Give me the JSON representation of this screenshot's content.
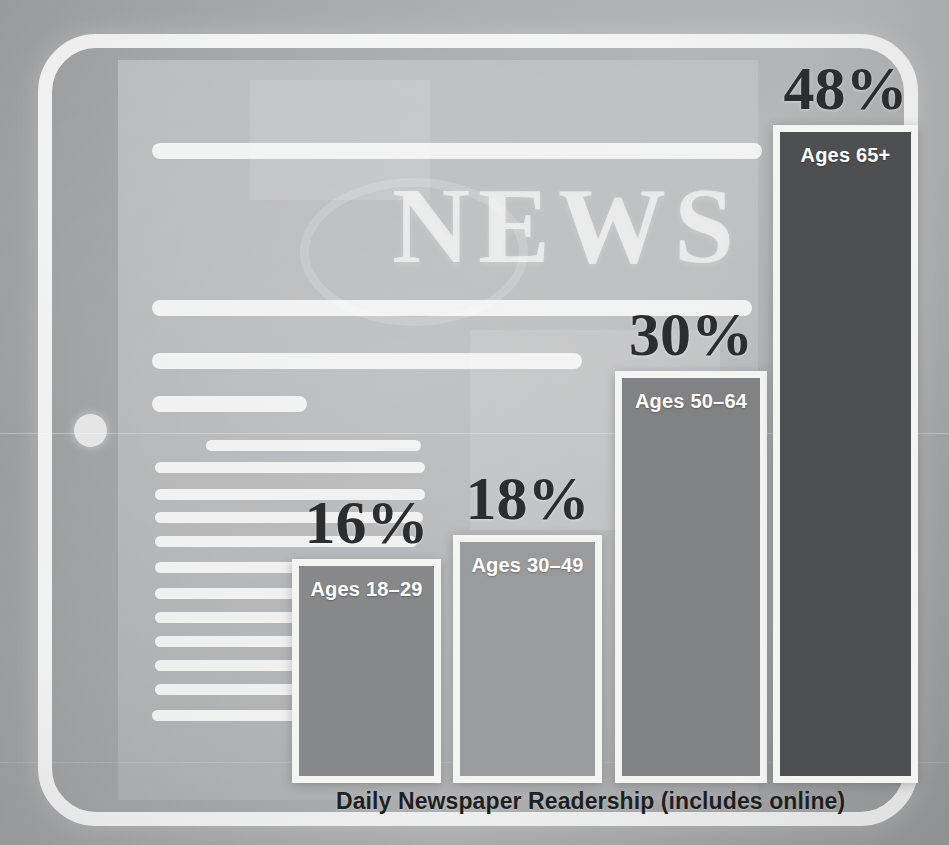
{
  "chart_data": {
    "type": "bar",
    "title": "Daily Newspaper Readership (includes online)",
    "xlabel": "",
    "ylabel": "",
    "ylim": [
      0,
      52
    ],
    "grid": false,
    "legend": "none",
    "categories": [
      "Ages 18–29",
      "Ages 30–49",
      "Ages 50–64",
      "Ages 65+"
    ],
    "values": [
      16,
      18,
      30,
      48
    ],
    "value_labels": [
      "16%",
      "18%",
      "30%",
      "48%"
    ],
    "series": [
      {
        "name": "Daily Newspaper Readership (includes online)",
        "values": [
          16,
          18,
          30,
          48
        ]
      }
    ],
    "bar_colors": [
      "#87888a",
      "#9a9b9d",
      "#818284",
      "#4e4f51"
    ],
    "bar_border_color": "#f4f4f3"
  },
  "bars": [
    {
      "label": "Ages 18–29",
      "value_label": "16%",
      "value": 16,
      "color": "#87888a",
      "x": 292,
      "width": 149,
      "top": 559
    },
    {
      "label": "Ages 30–49",
      "value_label": "18%",
      "value": 18,
      "color": "#9a9b9d",
      "x": 453,
      "width": 149,
      "top": 535
    },
    {
      "label": "Ages 50–64",
      "value_label": "30%",
      "value": 30,
      "color": "#818284",
      "x": 615,
      "width": 152,
      "top": 371
    },
    {
      "label": "Ages 65+",
      "value_label": "48%",
      "value": 48,
      "color": "#4e4f51",
      "x": 773,
      "width": 145,
      "top": 125
    }
  ],
  "caption": {
    "text": "Daily Newspaper Readership (includes online)"
  },
  "background": {
    "masthead": "NEWS",
    "device": "tablet-device",
    "home_button": "home-button-icon"
  },
  "colors": {
    "bar_border": "#f4f4f3",
    "value_text": "#2c2d2f",
    "label_text": "#ffffff",
    "caption_text": "#1e1f21",
    "backdrop": "#a2a3a5"
  }
}
